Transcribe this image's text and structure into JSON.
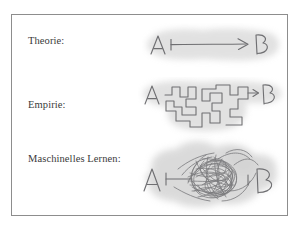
{
  "figure": {
    "frame": {
      "border_color": "#8d8d8d",
      "background": "#ffffff"
    },
    "ink_color": "#6f6f72",
    "halo_color": "#d6d6d6",
    "rows": [
      {
        "id": "theorie",
        "label": "Theorie:",
        "sketch_name": "straight-arrow-sketch",
        "description": "A with a single straight arrow pointing directly to B",
        "node_start": "A",
        "node_end": "B"
      },
      {
        "id": "empirie",
        "label": "Empirie:",
        "sketch_name": "maze-path-sketch",
        "description": "A connected to B by a long rectilinear maze-like detour path",
        "node_start": "A",
        "node_end": "B"
      },
      {
        "id": "maschinelles-lernen",
        "label": "Maschinelles Lernen:",
        "sketch_name": "scribble-tangle-sketch",
        "description": "A connected to B through a dense chaotic tangle of scribbled lines",
        "node_start": "A",
        "node_end": "B"
      }
    ]
  }
}
